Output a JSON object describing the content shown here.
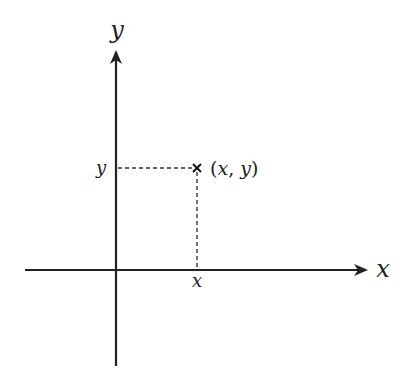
{
  "diagram": {
    "colors": {
      "axis": "#222222",
      "guide": "#333333",
      "background": "#ffffff"
    },
    "axes": {
      "x": {
        "label": "x",
        "from": [
          25,
          270
        ],
        "to": [
          368,
          270
        ]
      },
      "y": {
        "label": "y",
        "from": [
          116,
          366
        ],
        "to": [
          116,
          50
        ]
      }
    },
    "point": {
      "px": [
        197,
        168
      ],
      "marker": "cross",
      "label_open": "(",
      "label_x": "x",
      "label_sep": ", ",
      "label_y": "y",
      "label_close": ")"
    },
    "ticks": {
      "x_tick_label": "x",
      "y_tick_label": "y"
    }
  }
}
